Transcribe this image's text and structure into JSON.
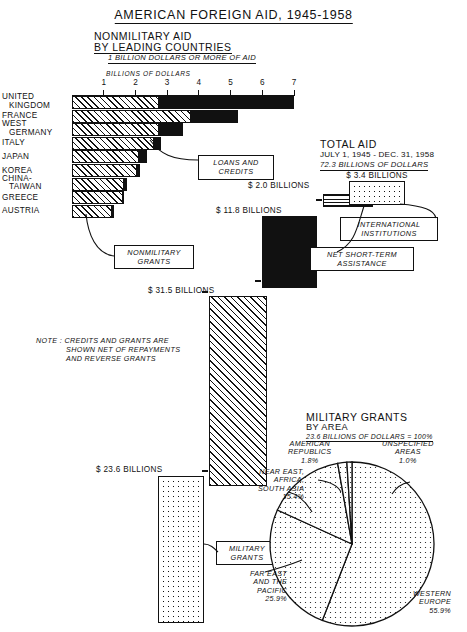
{
  "title": "AMERICAN FOREIGN AID, 1945-1958",
  "section1": {
    "title": "NONMILITARY AID",
    "subtitle": "BY LEADING COUNTRIES",
    "note": "1 BILLION DOLLARS OR MORE OF AID",
    "axis_caption": "BILLIONS OF DOLLARS",
    "callout_loans": "LOANS AND\nCREDITS",
    "callout_grants": "NONMILITARY\nGRANTS"
  },
  "note_block": {
    "line1": "NOTE : CREDITS AND GRANTS ARE",
    "line2": "SHOWN NET OF REPAYMENTS",
    "line3": "AND REVERSE GRANTS"
  },
  "total_aid": {
    "title": "TOTAL AID",
    "period": "JULY 1, 1945 - DEC. 31, 1958",
    "amount": "72.3 BILLIONS OF DOLLARS",
    "label_intl": "INTERNATIONAL\nINSTITUTIONS",
    "label_short": "NET SHORT-TERM\nASSISTANCE",
    "amt_loans": "$ 11.8 BILLIONS",
    "amt_short": "$ 2.0 BILLIONS",
    "amt_intl": "$ 3.4 BILLIONS",
    "amt_grants": "$ 31.5 BILLIONS",
    "amt_military": "$ 23.6 BILLIONS",
    "callout_military": "MILITARY\nGRANTS"
  },
  "chart_data": [
    {
      "type": "bar",
      "title": "NONMILITARY AID BY LEADING COUNTRIES",
      "subtitle": "1 BILLION DOLLARS OR MORE OF AID",
      "xlabel": "BILLIONS OF DOLLARS",
      "ylabel": "",
      "xlim": [
        0,
        7
      ],
      "xticks": [
        1,
        2,
        3,
        4,
        5,
        6,
        7
      ],
      "grid": false,
      "orientation": "horizontal",
      "stacked": true,
      "categories": [
        "UNITED KINGDOM",
        "FRANCE",
        "WEST GERMANY",
        "ITALY",
        "JAPAN",
        "KOREA",
        "CHINA-TAIWAN",
        "GREECE",
        "AUSTRIA"
      ],
      "series": [
        {
          "name": "NONMILITARY GRANTS",
          "values": [
            2.75,
            3.75,
            2.75,
            2.6,
            2.1,
            2.05,
            1.65,
            1.6,
            1.25
          ]
        },
        {
          "name": "LOANS AND CREDITS",
          "values": [
            4.25,
            1.5,
            0.75,
            0.2,
            0.25,
            0.1,
            0.1,
            0.05,
            0.08
          ]
        }
      ],
      "totals": [
        7.0,
        5.25,
        3.5,
        2.8,
        2.35,
        2.15,
        1.75,
        1.65,
        1.33
      ]
    },
    {
      "type": "bar",
      "title": "TOTAL AID",
      "subtitle": "JULY 1, 1945 - DEC. 31, 1958 — 72.3 BILLIONS OF DOLLARS",
      "categories": [
        "LOANS AND CREDITS",
        "NET SHORT-TERM ASSISTANCE",
        "INTERNATIONAL INSTITUTIONS",
        "NONMILITARY GRANTS",
        "MILITARY GRANTS"
      ],
      "values": [
        11.8,
        2.0,
        3.4,
        31.5,
        23.6
      ],
      "ylabel": "BILLIONS OF DOLLARS",
      "total": 72.3
    },
    {
      "type": "pie",
      "title": "MILITARY GRANTS",
      "subtitle": "BY AREA",
      "total_label": "23.6 BILLIONS OF DOLLARS = 100%",
      "categories": [
        "WESTERN EUROPE",
        "FAR EAST AND THE PACIFIC",
        "NEAR EAST, AFRICA, SOUTH ASIA",
        "AMERICAN REPUBLICS",
        "UNSPECIFIED AREAS"
      ],
      "values": [
        55.9,
        25.9,
        15.4,
        1.8,
        1.0
      ],
      "unit": "%"
    }
  ],
  "bar_rows": [
    {
      "name": "UNITED",
      "name2": "KINGDOM",
      "grants": 2.75,
      "loans": 4.25
    },
    {
      "name": "FRANCE",
      "name2": "",
      "grants": 3.75,
      "loans": 1.5
    },
    {
      "name": "WEST",
      "name2": "GERMANY",
      "grants": 2.75,
      "loans": 0.75
    },
    {
      "name": "ITALY",
      "name2": "",
      "grants": 2.6,
      "loans": 0.2
    },
    {
      "name": "JAPAN",
      "name2": "",
      "grants": 2.1,
      "loans": 0.25
    },
    {
      "name": "KOREA",
      "name2": "",
      "grants": 2.05,
      "loans": 0.1
    },
    {
      "name": "CHINA-",
      "name2": "TAIWAN",
      "grants": 1.65,
      "loans": 0.1
    },
    {
      "name": "GREECE",
      "name2": "",
      "grants": 1.6,
      "loans": 0.05
    },
    {
      "name": "AUSTRIA",
      "name2": "",
      "grants": 1.25,
      "loans": 0.08
    }
  ],
  "pie_labels": {
    "american_republics": "AMERICAN\nREPUBLICS\n1.8%",
    "unspecified": "UNSPECIFIED\nAREAS\n1.0%",
    "near_east": "NEAR EAST,\nAFRICA,\nSOUTH ASIA\n15.4%",
    "far_east": "FAR EAST\nAND THE\nPACIFIC\n25.9%",
    "western_europe": "WESTERN\nEUROPE\n55.9%"
  },
  "ticks": [
    "1",
    "2",
    "3",
    "4",
    "5",
    "6",
    "7"
  ]
}
